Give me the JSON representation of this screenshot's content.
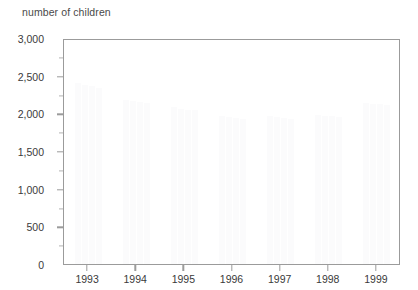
{
  "chart_data": {
    "type": "bar",
    "title": "number of children",
    "xlabel": "",
    "ylabel": "number of children",
    "categories": [
      "1993",
      "1994",
      "1995",
      "1996",
      "1997",
      "1998",
      "1999"
    ],
    "series": [
      {
        "name": "series-1",
        "values": [
          2400,
          2180,
          2080,
          1960,
          1960,
          1980,
          2140
        ]
      },
      {
        "name": "series-2",
        "values": [
          2380,
          2160,
          2060,
          1950,
          1950,
          1970,
          2130
        ]
      },
      {
        "name": "series-3",
        "values": [
          2360,
          2150,
          2050,
          1940,
          1940,
          1960,
          2120
        ]
      },
      {
        "name": "series-4",
        "values": [
          2340,
          2140,
          2040,
          1930,
          1930,
          1950,
          2110
        ]
      }
    ],
    "ylim": [
      0,
      3000
    ],
    "ytick_labels": [
      "0",
      "500",
      "1,000",
      "1,500",
      "2,000",
      "2,500",
      "3,000"
    ],
    "ytick_values": [
      0,
      500,
      1000,
      1500,
      2000,
      2500,
      3000
    ],
    "yminor_values": [
      250,
      750,
      1250,
      1750,
      2250,
      2750
    ],
    "grid": false,
    "legend": "none",
    "bar_color": "#fbfbfc",
    "axis_color": "#9b9b9b",
    "text_color": "#3a3a3a",
    "background": "#ffffff"
  }
}
